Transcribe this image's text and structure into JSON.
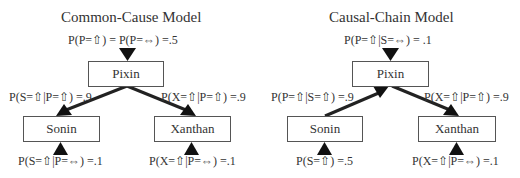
{
  "diagrams": [
    {
      "title": "Common-Cause Model",
      "nodes": {
        "pixin": "Pixin",
        "sonin": "Sonin",
        "xanthan": "Xanthan"
      },
      "labels": {
        "top": "P(P=⇧) = P(P=⇔) =.5",
        "left_edge": "P(S=⇧|P=⇧) =.9",
        "right_edge": "P(X=⇧|P=⇧) =.9",
        "bottom_left": "P(S=⇧|P=⇔) =.1",
        "bottom_right": "P(X=⇧|P=⇔) =.1"
      },
      "edges": [
        {
          "from": "Pixin",
          "to": "Sonin"
        },
        {
          "from": "Pixin",
          "to": "Xanthan"
        }
      ]
    },
    {
      "title": "Causal-Chain Model",
      "nodes": {
        "pixin": "Pixin",
        "sonin": "Sonin",
        "xanthan": "Xanthan"
      },
      "labels": {
        "top": "P(P=⇧|S=⇔) = .1",
        "left_edge": "P(P=⇧|S=⇧) =.9",
        "right_edge": "P(X=⇧|P=⇧) =.9",
        "bottom_left": "P(S=⇧) =.5",
        "bottom_right": "P(X=⇧|P=⇔) =.1"
      },
      "edges": [
        {
          "from": "Sonin",
          "to": "Pixin"
        },
        {
          "from": "Pixin",
          "to": "Xanthan"
        }
      ]
    }
  ]
}
